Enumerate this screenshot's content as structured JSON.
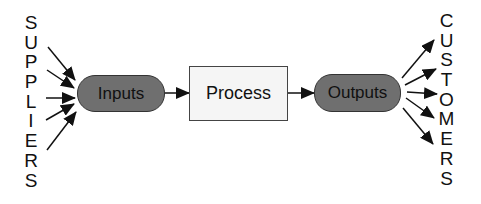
{
  "diagram": {
    "suppliers_label": "SUPPLIERS",
    "customers_label": "CUSTOMERS",
    "nodes": {
      "inputs": "Inputs",
      "process": "Process",
      "outputs": "Outputs"
    },
    "colors": {
      "pill_fill": "#6f6f6f",
      "box_fill": "#f5f5f5",
      "stroke": "#111111"
    },
    "supplier_arrow_count": 5,
    "customer_arrow_count": 5
  }
}
